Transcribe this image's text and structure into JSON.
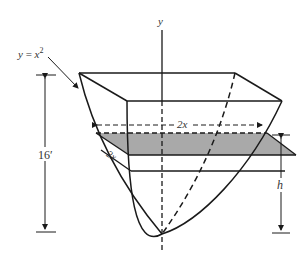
{
  "diagram": {
    "labels": {
      "y_axis": "y",
      "curve": "y = x",
      "curve_exponent": "2",
      "width_back": "2x",
      "width_front": "2x",
      "total_height": "16′",
      "slice_height": "h"
    },
    "colors": {
      "stroke": "#1a1a1a",
      "slice_fill": "#a9a9a9",
      "background": "#ffffff",
      "label": "#333333"
    }
  }
}
